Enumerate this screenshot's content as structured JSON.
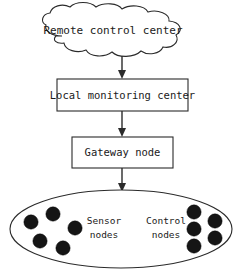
{
  "diagram": {
    "colors": {
      "background": "#ffffff",
      "stroke": "#2b2b2b",
      "text": "#1a1a1a",
      "dot_fill": "#151515"
    },
    "cloud": {
      "label": "Remote control center",
      "shape": "cloud"
    },
    "boxes": [
      {
        "label": "Local monitoring center",
        "shape": "rectangle"
      },
      {
        "label": "Gateway node",
        "shape": "rectangle"
      }
    ],
    "ellipse": {
      "shape": "ellipse",
      "clusters": [
        {
          "label_line1": "Sensor",
          "label_line2": "nodes",
          "dot_count": 5
        },
        {
          "label_line1": "Control",
          "label_line2": "nodes",
          "dot_count": 5
        }
      ]
    },
    "connectors": [
      {
        "from": "Remote control center",
        "to": "Local monitoring center",
        "style": "arrow-down"
      },
      {
        "from": "Local monitoring center",
        "to": "Gateway node",
        "style": "arrow-down"
      },
      {
        "from": "Gateway node",
        "to": "Sensor and control node field",
        "style": "arrow-down"
      }
    ]
  }
}
